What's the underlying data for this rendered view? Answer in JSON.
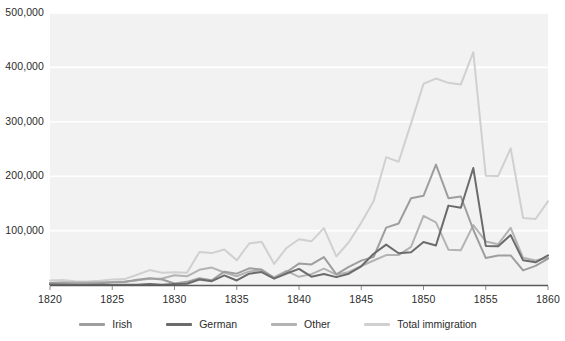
{
  "chart_data": {
    "type": "line",
    "title": "",
    "subtitle": "",
    "xlabel": "",
    "ylabel": "",
    "xlim": [
      1820,
      1860
    ],
    "ylim": [
      0,
      500000
    ],
    "grid": true,
    "grid_axis": "y",
    "legend_position": "bottom",
    "x": [
      1820,
      1821,
      1822,
      1823,
      1824,
      1825,
      1826,
      1827,
      1828,
      1829,
      1830,
      1831,
      1832,
      1833,
      1834,
      1835,
      1836,
      1837,
      1838,
      1839,
      1840,
      1841,
      1842,
      1843,
      1844,
      1845,
      1846,
      1847,
      1848,
      1849,
      1850,
      1851,
      1852,
      1853,
      1854,
      1855,
      1856,
      1857,
      1858,
      1859,
      1860
    ],
    "xticks": [
      1820,
      1825,
      1830,
      1835,
      1840,
      1845,
      1850,
      1855,
      1860
    ],
    "xticklabels": [
      "1820",
      "1825",
      "1830",
      "1835",
      "1840",
      "1845",
      "1850",
      "1855",
      "1860"
    ],
    "yticks": [
      100000,
      200000,
      300000,
      400000,
      500000
    ],
    "yticklabels": [
      "100,000",
      "200,000",
      "300,000",
      "400,000",
      "500,000"
    ],
    "series": [
      {
        "name": "Irish",
        "color": "#9e9e9e",
        "values": [
          3614,
          3000,
          2800,
          2900,
          3000,
          4888,
          5500,
          9500,
          12500,
          10000,
          2721,
          5772,
          12436,
          8648,
          24474,
          20927,
          30578,
          28508,
          12645,
          23963,
          39430,
          37772,
          51342,
          19670,
          33490,
          44821,
          51752,
          105536,
          112934,
          159398,
          164004,
          221253,
          159548,
          162649,
          101606,
          49627,
          54349,
          54361,
          26873,
          35216,
          48637
        ]
      },
      {
        "name": "German",
        "color": "#6b6b6b",
        "values": [
          968,
          400,
          148,
          183,
          230,
          450,
          511,
          432,
          1851,
          597,
          1976,
          2413,
          10194,
          6988,
          17686,
          8311,
          20707,
          23740,
          11683,
          21028,
          29704,
          15291,
          20370,
          14441,
          20731,
          34355,
          57561,
          74281,
          58465,
          60235,
          78896,
          72482,
          145918,
          141946,
          215009,
          71918,
          71028,
          91781,
          45310,
          41784,
          54491
        ]
      },
      {
        "name": "Other",
        "color": "#b3b3b3",
        "values": [
          3806,
          5000,
          4500,
          4500,
          5000,
          5500,
          6500,
          8500,
          11500,
          12000,
          18000,
          16000,
          28000,
          32000,
          23000,
          16000,
          25000,
          27000,
          14000,
          26000,
          15000,
          20000,
          30000,
          19000,
          24000,
          35000,
          45000,
          55000,
          55000,
          70000,
          127000,
          115000,
          65000,
          64000,
          110000,
          80000,
          75000,
          105000,
          50000,
          45000,
          50000
        ]
      },
      {
        "name": "Total immigration",
        "color": "#d0d0d0",
        "values": [
          8385,
          9127,
          6911,
          6354,
          7912,
          10199,
          10837,
          18875,
          27382,
          22520,
          23322,
          22633,
          60482,
          58640,
          65365,
          45374,
          76242,
          79340,
          38914,
          68069,
          84066,
          80289,
          104565,
          52496,
          78615,
          114371,
          154416,
          234968,
          226527,
          297024,
          369980,
          379466,
          371603,
          368645,
          427833,
          200877,
          200436,
          251306,
          123126,
          121282,
          153640
        ]
      }
    ]
  },
  "legend": {
    "items": [
      {
        "label": "Irish",
        "color": "#9e9e9e"
      },
      {
        "label": "German",
        "color": "#6b6b6b"
      },
      {
        "label": "Other",
        "color": "#b3b3b3"
      },
      {
        "label": "Total immigration",
        "color": "#d0d0d0"
      }
    ]
  },
  "axes": {
    "y_labels": [
      "500,000",
      "400,000",
      "300,000",
      "200,000",
      "100,000"
    ],
    "x_labels": [
      "1820",
      "1825",
      "1830",
      "1835",
      "1840",
      "1845",
      "1850",
      "1855",
      "1860"
    ]
  },
  "colors": {
    "plot_background": "#f2f2f2",
    "gridline": "#ffffff",
    "axis_text": "#2b2b2b",
    "axis_line": "#5a5a5a"
  }
}
